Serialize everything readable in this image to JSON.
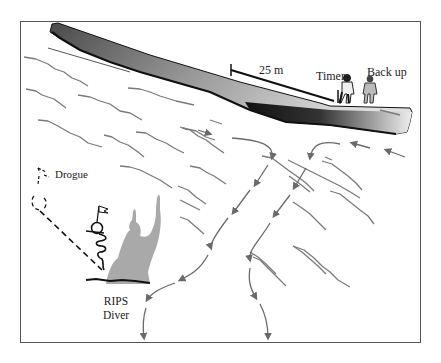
{
  "figure": {
    "labels": {
      "distance": "25 m",
      "timer": "Timer",
      "backup": "Back up",
      "drogue": "Drogue",
      "diver_line1": "RIPS",
      "diver_line2": "Diver"
    },
    "colors": {
      "frame": "#555555",
      "pier_dark": "#111111",
      "pier_light": "#d8d8d8",
      "wave": "#7a7a7a",
      "current_arrow": "#6a6a6a",
      "diver_silhouette": "#a9a9a9",
      "line": "#111111"
    },
    "elements": {
      "pier": "pier/jetty structure shaded gradient",
      "waves": "wave crest lines",
      "rip_current": "rip current flow arrows (two channels flowing seaward)",
      "observers": [
        "Timer",
        "Back up"
      ],
      "drogue": "dashed tether to drogue",
      "diver": "RIPS diver silhouette with buoy and flag"
    }
  }
}
